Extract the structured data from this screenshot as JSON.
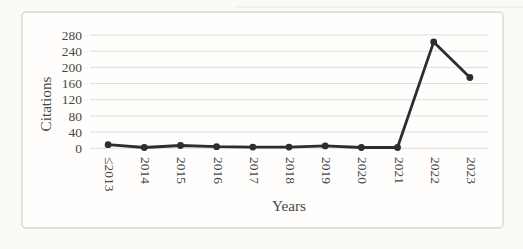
{
  "chart_data": {
    "type": "line",
    "categories": [
      "≤2013",
      "2014",
      "2015",
      "2016",
      "2017",
      "2018",
      "2019",
      "2020",
      "2021",
      "2022",
      "2023"
    ],
    "values": [
      9,
      2,
      7,
      4,
      3,
      3,
      6,
      2,
      2,
      263,
      175
    ],
    "title": "",
    "xlabel": "Years",
    "ylabel": "Citations",
    "ylim": [
      0,
      280
    ],
    "yticks": [
      0,
      40,
      80,
      120,
      160,
      200,
      240,
      280
    ],
    "ytick_step": 40,
    "grid": "horizontal",
    "legend": "none",
    "line_color": "#2d2d2d",
    "marker_color": "#2d2d2d",
    "marker_shape": "circle",
    "gridline_color": "#dddcd8",
    "text_color": "#474747",
    "panel_background": "#fffefc",
    "panel_border_color": "#d9d7d2"
  }
}
